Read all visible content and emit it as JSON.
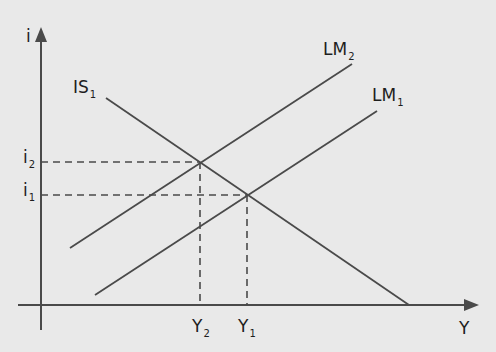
{
  "diagram": {
    "type": "IS-LM",
    "colors": {
      "background": "#e9e9e9",
      "line": "#4a4a4a",
      "axis": "#4a4a4a",
      "text": "#1e1e1e"
    },
    "axes": {
      "y": {
        "label": "i"
      },
      "x": {
        "label": "Y"
      }
    },
    "curves": [
      {
        "id": "IS1",
        "label": "IS",
        "subscript": "1",
        "slope": "downward"
      },
      {
        "id": "LM2",
        "label": "LM",
        "subscript": "2",
        "slope": "upward"
      },
      {
        "id": "LM1",
        "label": "LM",
        "subscript": "1",
        "slope": "upward"
      }
    ],
    "equilibria": [
      {
        "id": "E2",
        "curves": [
          "IS1",
          "LM2"
        ],
        "i_label": "i",
        "i_sub": "2",
        "y_label": "Y",
        "y_sub": "2"
      },
      {
        "id": "E1",
        "curves": [
          "IS1",
          "LM1"
        ],
        "i_label": "i",
        "i_sub": "1",
        "y_label": "Y",
        "y_sub": "1"
      }
    ]
  }
}
